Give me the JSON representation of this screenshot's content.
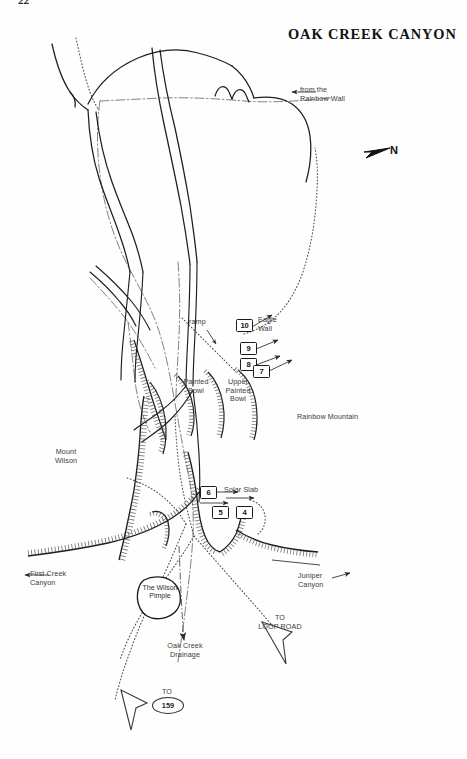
{
  "page": {
    "number": "22",
    "title": "OAK CREEK CANYON",
    "width": 467,
    "height": 759,
    "background_color": "#fefefe",
    "ink_color": "#1b1b1b"
  },
  "compass": {
    "label": "N",
    "icon": "north-arrow-icon",
    "direction": "right"
  },
  "annotations": {
    "from_rainbow_wall": "from the\nRainbow Wall",
    "ramp": "ramp",
    "eagle_wall": "Eagle\nWall",
    "painted_bowl": "Painted\nBowl",
    "upper_painted_bowl": "Upper\nPainted\nBowl",
    "rainbow_mountain": "Rainbow Mountain",
    "mount_wilson": "Mount\nWilson",
    "first_creek_canyon": "First Creek\nCanyon",
    "juniper_canyon": "Juniper\nCanyon",
    "solar_slab": "Solar Slab",
    "wilson_pimple": "The\nWilson\nPimple",
    "oak_creek_drainage": "Oak Creek\nDrainage",
    "to_loop_road": "TO\nLOOP ROAD",
    "to_159_prefix": "TO",
    "to_159_shield": "159"
  },
  "route_markers": [
    {
      "id": "marker-10",
      "label": "10",
      "x": 236,
      "y": 325
    },
    {
      "id": "marker-9",
      "label": "9",
      "x": 240,
      "y": 346
    },
    {
      "id": "marker-8",
      "label": "8",
      "x": 240,
      "y": 362
    },
    {
      "id": "marker-7",
      "label": "7",
      "x": 253,
      "y": 368
    },
    {
      "id": "marker-6",
      "label": "6",
      "x": 200,
      "y": 487
    },
    {
      "id": "marker-5",
      "label": "5",
      "x": 212,
      "y": 508
    },
    {
      "id": "marker-4",
      "label": "4",
      "x": 236,
      "y": 508
    }
  ],
  "legend_features": {
    "cliff_band": "hachured cliff line",
    "drainage": "dash-dot drainage line",
    "trail": "dotted approach trail",
    "ridge": "solid ridge line"
  }
}
